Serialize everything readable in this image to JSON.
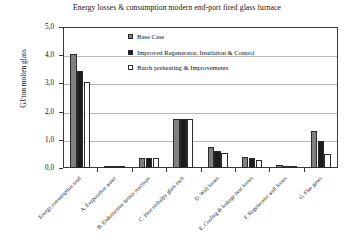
{
  "chart_data": {
    "type": "bar",
    "title": "Energy losses & consumption modern end-port fired glass furnace",
    "xlabel": "",
    "ylabel": "GJ/ton molten glass",
    "ylim": [
      0.0,
      5.0
    ],
    "ytick_labels": [
      "0,0",
      "1,0",
      "2,0",
      "3,0",
      "4,0",
      "5,0"
    ],
    "ytick_values": [
      0.0,
      1.0,
      2.0,
      3.0,
      4.0,
      5.0
    ],
    "grid": true,
    "legend_position": "inside-top-center",
    "categories": [
      "Energy consumption total",
      "A. Evaporation water",
      "B. Endothermic fusion reactions",
      "C. Heat enthalpy glass melt",
      "D. Wall losses",
      "E. Cooling & leakage heat losses",
      "F. Regenerator wall losses",
      "G. Flue gases"
    ],
    "series": [
      {
        "name": "Base Case",
        "color": "#808080",
        "values": [
          4.05,
          0.06,
          0.35,
          1.75,
          0.75,
          0.4,
          0.1,
          1.3
        ]
      },
      {
        "name": "Improved Regenerator, Insulation & Control",
        "color": "#1c1c1c",
        "values": [
          3.45,
          0.05,
          0.35,
          1.75,
          0.6,
          0.35,
          0.08,
          0.95
        ]
      },
      {
        "name": "Batch preheating & Improvements",
        "color": "#ffffff",
        "values": [
          3.05,
          0.04,
          0.35,
          1.75,
          0.55,
          0.3,
          0.05,
          0.5
        ]
      }
    ]
  }
}
